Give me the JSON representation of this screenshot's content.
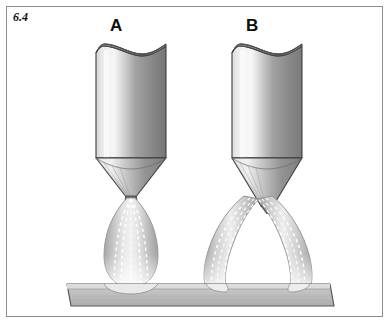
{
  "figure": {
    "number": "6.4",
    "caption_text": "6.4",
    "frame_border_color": "#8d8d8d",
    "background_color": "#ffffff"
  },
  "labels": {
    "nozzle_a": "A",
    "nozzle_b": "B"
  },
  "diagram": {
    "type": "technical-illustration",
    "palette": {
      "metal_dark": "#6f6f6f",
      "metal_mid": "#9a9a9a",
      "metal_light": "#e8e8e8",
      "metal_highlight": "#f2f2f2",
      "outline": "#3a3a3a",
      "plume_fill": "#b9b9b9",
      "plume_light": "#f4f4f4",
      "streamline": "#ffffff",
      "plate_face": "#bcbcbc",
      "plate_top": "#d9d9d9",
      "plate_outline": "#585858"
    },
    "elements": [
      {
        "name": "nozzle-a",
        "label": "A",
        "body": "cylinder with saddle-cut top rim",
        "tip": "short wide cone",
        "plume": "single convergent teardrop jet",
        "streamline_count": 4,
        "impingement": "single narrow footprint"
      },
      {
        "name": "nozzle-b",
        "label": "B",
        "body": "cylinder with saddle-cut top rim",
        "tip": "long narrow pointed cone",
        "plume": "twin divergent curved jets",
        "streamline_count": 6,
        "impingement": "two separated footprints"
      },
      {
        "name": "plate",
        "description": "horizontal target plate / substrate slab"
      }
    ]
  }
}
